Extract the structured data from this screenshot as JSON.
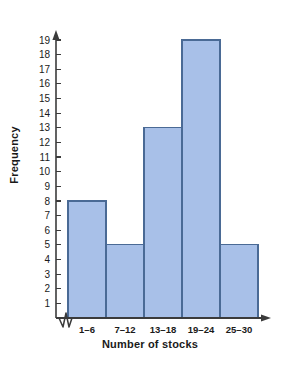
{
  "chart_data": {
    "type": "bar",
    "title": "",
    "xlabel": "Number of stocks",
    "ylabel": "Frequency",
    "categories": [
      "1–6",
      "7–12",
      "13–18",
      "19–24",
      "25–30"
    ],
    "values": [
      8,
      5,
      13,
      19,
      5
    ],
    "ylim": [
      0,
      19
    ],
    "yticks": [
      1,
      2,
      3,
      4,
      5,
      6,
      7,
      8,
      9,
      10,
      11,
      12,
      13,
      14,
      15,
      16,
      17,
      18,
      19
    ],
    "ytick_labels": [
      "1",
      "2",
      "3",
      "4",
      "5",
      "6",
      "7",
      "8",
      "9",
      "10",
      "11",
      "12",
      "13",
      "14",
      "15",
      "16",
      "17",
      "18",
      "19"
    ],
    "grid": false,
    "legend": null,
    "axis_break": true,
    "axis_arrows": true,
    "bar_fill_color": "#a8c0e8",
    "bar_border_color": "#4a6a95",
    "axis_color": "#3b3b3b",
    "text_color": "#1a1a1a"
  }
}
